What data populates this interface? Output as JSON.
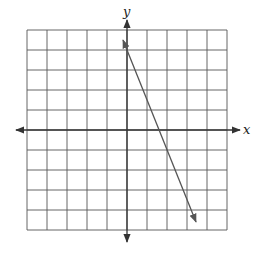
{
  "chart_data": {
    "type": "line",
    "title": "",
    "xlabel": "x",
    "ylabel": "y",
    "xlim": [
      -5,
      5
    ],
    "ylim": [
      -5,
      5
    ],
    "grid": true,
    "grid_step": 1,
    "tick_labels": false,
    "series": [
      {
        "name": "line",
        "equation": "y = -2.5x + 4",
        "slope": -2.5,
        "y_intercept": 4,
        "x_intercept": 1.6,
        "x": [
          -0.2,
          3.45
        ],
        "y": [
          4.5,
          -4.6
        ],
        "arrows_both_ends": true,
        "color": "#555555"
      }
    ]
  },
  "labels": {
    "x_axis": "x",
    "y_axis": "y"
  },
  "colors": {
    "grid": "#555555",
    "axis": "#333333",
    "line": "#555555"
  }
}
